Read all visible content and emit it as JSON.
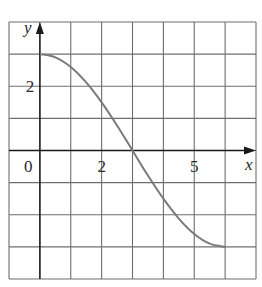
{
  "chart_data": {
    "type": "line",
    "title": "",
    "xlabel": "x",
    "ylabel": "y",
    "xlim": [
      -1,
      7
    ],
    "ylim": [
      -4,
      4
    ],
    "grid": true,
    "grid_step": 1,
    "x_tick_labels": [
      {
        "value": 2,
        "label": "2"
      },
      {
        "value": 5,
        "label": "5"
      }
    ],
    "y_tick_labels": [
      {
        "value": 2,
        "label": "2"
      }
    ],
    "origin_label": "0",
    "series": [
      {
        "name": "f",
        "color": "#7a7a7a",
        "x": [
          0,
          0.5,
          1,
          1.5,
          2,
          2.5,
          3,
          3.5,
          4,
          4.5,
          5,
          5.5,
          6
        ],
        "y": [
          3,
          2.9,
          2.6,
          2.12,
          1.5,
          0.78,
          0,
          -0.78,
          -1.5,
          -2.12,
          -2.6,
          -2.9,
          -3
        ]
      }
    ],
    "annotations": []
  },
  "colors": {
    "grid": "#6e6e6e",
    "axis": "#1a1a1a",
    "curve": "#7a7a7a",
    "background": "#ffffff"
  }
}
